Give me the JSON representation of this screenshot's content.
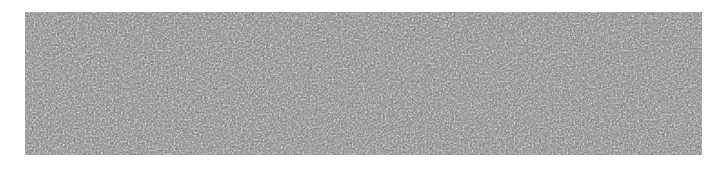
{
  "image": {
    "description": "Dense grayscale noise texture of fine white fibrous strands on a dark background",
    "colors": {
      "background": "#ffffff",
      "texture_dark": "#2e2e2e",
      "texture_light": "#e8e8e8"
    },
    "texture_bounds": {
      "x": 25,
      "y": 12,
      "width": 677,
      "height": 143
    }
  }
}
